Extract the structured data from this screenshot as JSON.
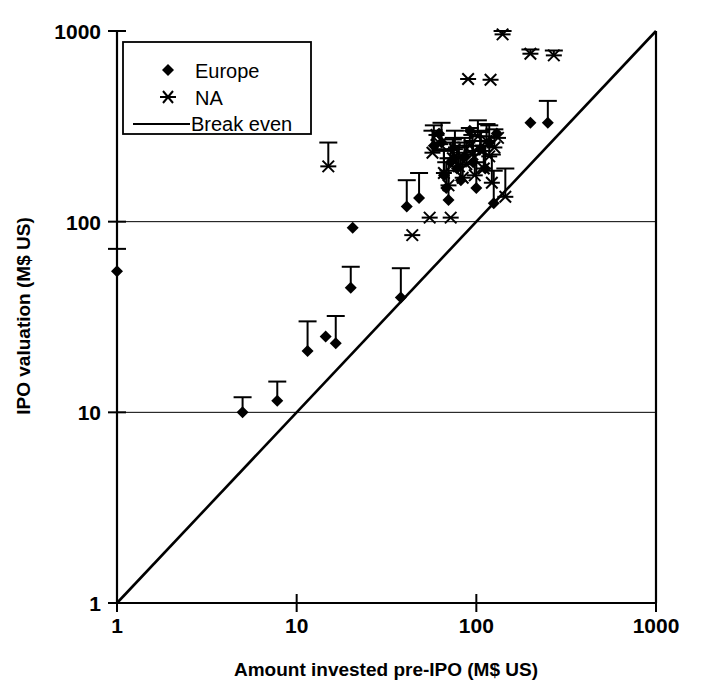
{
  "chart_data": {
    "type": "scatter",
    "title": "",
    "subtitle": "",
    "xlabel": "Amount invested pre-IPO (M$ US)",
    "ylabel": "IPO valuation (M$ US)",
    "xscale": "log",
    "yscale": "log",
    "xlim": [
      1,
      1000
    ],
    "ylim": [
      1,
      1000
    ],
    "xticks": [
      1,
      10,
      100,
      1000
    ],
    "xticklabels": [
      "1",
      "10",
      "100",
      "1000"
    ],
    "yticks": [
      1,
      10,
      100,
      1000
    ],
    "yticklabels": [
      "1",
      "10",
      "100",
      "1000"
    ],
    "grid": "horizontal-at-y-10-and-100",
    "legend_position": "top-left-inside",
    "legend": [
      {
        "label": "Europe",
        "marker": "diamond-marker"
      },
      {
        "label": "NA",
        "marker": "asterisk-marker"
      },
      {
        "label": "Break even",
        "marker": "line-marker"
      }
    ],
    "annotations": [
      "Error bars extend upward from each marker",
      "Break even line is the y = x diagonal from (1,1) to (1000,1000)"
    ],
    "reference_line": {
      "name": "Break even",
      "from": [
        1,
        1
      ],
      "to": [
        1000,
        1000
      ]
    },
    "series": [
      {
        "name": "Europe",
        "marker": "diamond-marker",
        "points": [
          {
            "x": 1.0,
            "y": 55,
            "yerr_top": 72
          },
          {
            "x": 5.0,
            "y": 10,
            "yerr_top": 12
          },
          {
            "x": 7.8,
            "y": 11.5,
            "yerr_top": 14.5
          },
          {
            "x": 11.5,
            "y": 21,
            "yerr_top": 30
          },
          {
            "x": 14.5,
            "y": 25,
            "yerr_top": 25
          },
          {
            "x": 16.5,
            "y": 23,
            "yerr_top": 32
          },
          {
            "x": 20.0,
            "y": 45,
            "yerr_top": 58
          },
          {
            "x": 20.5,
            "y": 93,
            "yerr_top": 93
          },
          {
            "x": 38.0,
            "y": 40,
            "yerr_top": 57
          },
          {
            "x": 41.0,
            "y": 120,
            "yerr_top": 165
          },
          {
            "x": 48.0,
            "y": 133,
            "yerr_top": 180
          },
          {
            "x": 58.0,
            "y": 250,
            "yerr_top": 320
          },
          {
            "x": 62.0,
            "y": 290,
            "yerr_top": 290
          },
          {
            "x": 64.0,
            "y": 260,
            "yerr_top": 330
          },
          {
            "x": 66.0,
            "y": 175,
            "yerr_top": 235
          },
          {
            "x": 68.0,
            "y": 150,
            "yerr_top": 205
          },
          {
            "x": 70.0,
            "y": 130,
            "yerr_top": 185
          },
          {
            "x": 72.0,
            "y": 205,
            "yerr_top": 260
          },
          {
            "x": 75.0,
            "y": 215,
            "yerr_top": 275
          },
          {
            "x": 78.0,
            "y": 190,
            "yerr_top": 245
          },
          {
            "x": 82.0,
            "y": 165,
            "yerr_top": 220
          },
          {
            "x": 86.0,
            "y": 220,
            "yerr_top": 275
          },
          {
            "x": 92.0,
            "y": 300,
            "yerr_top": 300
          },
          {
            "x": 96.0,
            "y": 205,
            "yerr_top": 265
          },
          {
            "x": 100.0,
            "y": 150,
            "yerr_top": 205
          },
          {
            "x": 105.0,
            "y": 240,
            "yerr_top": 300
          },
          {
            "x": 112.0,
            "y": 190,
            "yerr_top": 250
          },
          {
            "x": 118.0,
            "y": 260,
            "yerr_top": 320
          },
          {
            "x": 125.0,
            "y": 125,
            "yerr_top": 185
          },
          {
            "x": 130.0,
            "y": 290,
            "yerr_top": 290
          },
          {
            "x": 200.0,
            "y": 330,
            "yerr_top": 330
          },
          {
            "x": 250.0,
            "y": 330,
            "yerr_top": 430
          }
        ]
      },
      {
        "name": "NA",
        "marker": "asterisk-marker",
        "points": [
          {
            "x": 15.0,
            "y": 195,
            "yerr_top": 260
          },
          {
            "x": 44.0,
            "y": 85,
            "yerr_top": 85
          },
          {
            "x": 55.0,
            "y": 105,
            "yerr_top": 105
          },
          {
            "x": 57.0,
            "y": 230,
            "yerr_top": 300
          },
          {
            "x": 60.0,
            "y": 285,
            "yerr_top": 285
          },
          {
            "x": 63.0,
            "y": 255,
            "yerr_top": 255
          },
          {
            "x": 66.0,
            "y": 180,
            "yerr_top": 240
          },
          {
            "x": 70.0,
            "y": 155,
            "yerr_top": 215
          },
          {
            "x": 72.0,
            "y": 105,
            "yerr_top": 105
          },
          {
            "x": 74.0,
            "y": 215,
            "yerr_top": 270
          },
          {
            "x": 76.0,
            "y": 240,
            "yerr_top": 300
          },
          {
            "x": 80.0,
            "y": 195,
            "yerr_top": 250
          },
          {
            "x": 84.0,
            "y": 170,
            "yerr_top": 230
          },
          {
            "x": 88.0,
            "y": 200,
            "yerr_top": 260
          },
          {
            "x": 90.0,
            "y": 560,
            "yerr_top": 560
          },
          {
            "x": 92.0,
            "y": 250,
            "yerr_top": 310
          },
          {
            "x": 95.0,
            "y": 225,
            "yerr_top": 285
          },
          {
            "x": 98.0,
            "y": 175,
            "yerr_top": 235
          },
          {
            "x": 102.0,
            "y": 280,
            "yerr_top": 340
          },
          {
            "x": 106.0,
            "y": 235,
            "yerr_top": 295
          },
          {
            "x": 110.0,
            "y": 190,
            "yerr_top": 250
          },
          {
            "x": 114.0,
            "y": 265,
            "yerr_top": 325
          },
          {
            "x": 118.0,
            "y": 220,
            "yerr_top": 280
          },
          {
            "x": 120.0,
            "y": 555,
            "yerr_top": 555
          },
          {
            "x": 122.0,
            "y": 160,
            "yerr_top": 225
          },
          {
            "x": 126.0,
            "y": 245,
            "yerr_top": 305
          },
          {
            "x": 132.0,
            "y": 275,
            "yerr_top": 275
          },
          {
            "x": 140.0,
            "y": 960,
            "yerr_top": 1000
          },
          {
            "x": 145.0,
            "y": 135,
            "yerr_top": 190
          },
          {
            "x": 200.0,
            "y": 760,
            "yerr_top": 800
          },
          {
            "x": 270.0,
            "y": 745,
            "yerr_top": 790
          }
        ]
      }
    ]
  }
}
